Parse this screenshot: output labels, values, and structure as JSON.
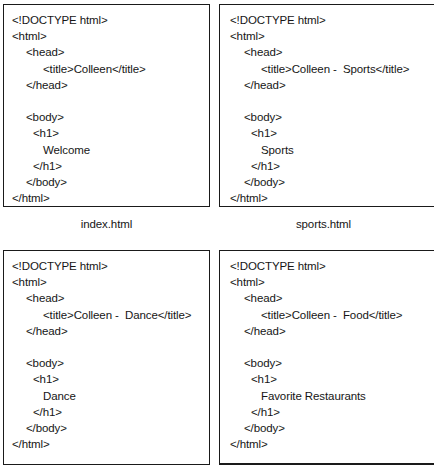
{
  "figure": {
    "panels": [
      {
        "id": "index",
        "caption": "index.html",
        "position": "top-left",
        "lines": [
          {
            "text": "<!DOCTYPE html>",
            "indent": "ind-0"
          },
          {
            "text": "<html>",
            "indent": "ind-0"
          },
          {
            "text": "<head>",
            "indent": "ind-1"
          },
          {
            "text": "<title>Colleen</title>",
            "indent": "ind-t"
          },
          {
            "text": "</head>",
            "indent": "ind-1"
          },
          {
            "text": "",
            "indent": "ind-0"
          },
          {
            "text": "<body>",
            "indent": "ind-1"
          },
          {
            "text": "<h1>",
            "indent": "ind-h"
          },
          {
            "text": "Welcome",
            "indent": "ind-t"
          },
          {
            "text": "</h1>",
            "indent": "ind-h"
          },
          {
            "text": "</body>",
            "indent": "ind-1"
          },
          {
            "text": "</html>",
            "indent": "ind-0"
          }
        ]
      },
      {
        "id": "sports",
        "caption": "sports.html",
        "position": "top-right",
        "lines": [
          {
            "text": "<!DOCTYPE html>",
            "indent": "ind-0"
          },
          {
            "text": "<html>",
            "indent": "ind-0"
          },
          {
            "text": "<head>",
            "indent": "ind-1"
          },
          {
            "text": "<title>Colleen -  Sports</title>",
            "indent": "ind-t"
          },
          {
            "text": "</head>",
            "indent": "ind-1"
          },
          {
            "text": "",
            "indent": "ind-0"
          },
          {
            "text": "<body>",
            "indent": "ind-1"
          },
          {
            "text": "<h1>",
            "indent": "ind-h"
          },
          {
            "text": "Sports",
            "indent": "ind-t"
          },
          {
            "text": "</h1>",
            "indent": "ind-h"
          },
          {
            "text": "</body>",
            "indent": "ind-1"
          },
          {
            "text": "</html>",
            "indent": "ind-0"
          }
        ]
      },
      {
        "id": "dance",
        "caption": "",
        "position": "bottom-left",
        "lines": [
          {
            "text": "<!DOCTYPE html>",
            "indent": "ind-0"
          },
          {
            "text": "<html>",
            "indent": "ind-0"
          },
          {
            "text": "<head>",
            "indent": "ind-1"
          },
          {
            "text": "<title>Colleen -  Dance</title>",
            "indent": "ind-t"
          },
          {
            "text": "</head>",
            "indent": "ind-1"
          },
          {
            "text": "",
            "indent": "ind-0"
          },
          {
            "text": "<body>",
            "indent": "ind-1"
          },
          {
            "text": "<h1>",
            "indent": "ind-h"
          },
          {
            "text": "Dance",
            "indent": "ind-t"
          },
          {
            "text": "</h1>",
            "indent": "ind-h"
          },
          {
            "text": "</body>",
            "indent": "ind-1"
          },
          {
            "text": "</html>",
            "indent": "ind-0"
          }
        ]
      },
      {
        "id": "food",
        "caption": "",
        "position": "bottom-right",
        "lines": [
          {
            "text": "<!DOCTYPE html>",
            "indent": "ind-0"
          },
          {
            "text": "<html>",
            "indent": "ind-0"
          },
          {
            "text": "<head>",
            "indent": "ind-1"
          },
          {
            "text": "<title>Colleen -  Food</title>",
            "indent": "ind-t"
          },
          {
            "text": "</head>",
            "indent": "ind-1"
          },
          {
            "text": "",
            "indent": "ind-0"
          },
          {
            "text": "<body>",
            "indent": "ind-1"
          },
          {
            "text": "<h1>",
            "indent": "ind-h"
          },
          {
            "text": "Favorite Restaurants",
            "indent": "ind-t"
          },
          {
            "text": "</h1>",
            "indent": "ind-h"
          },
          {
            "text": "</body>",
            "indent": "ind-1"
          },
          {
            "text": "</html>",
            "indent": "ind-0"
          }
        ]
      }
    ]
  }
}
